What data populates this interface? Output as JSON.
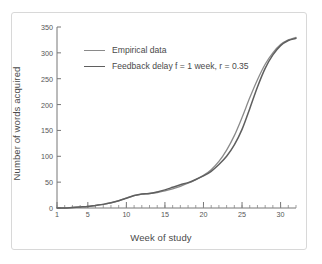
{
  "figure": {
    "frame_color": "#d8d8d8",
    "background": "#ffffff"
  },
  "chart_data": {
    "type": "line",
    "title": "",
    "xlabel": "Week of study",
    "ylabel": "Number of words acquired",
    "xlim": [
      1,
      32
    ],
    "ylim": [
      0,
      350
    ],
    "xticks": [
      1,
      5,
      10,
      15,
      20,
      25,
      30
    ],
    "yticks": [
      0,
      50,
      100,
      150,
      200,
      250,
      300,
      350
    ],
    "xtick_labels": [
      "1",
      "5",
      "10",
      "15",
      "20",
      "25",
      "30"
    ],
    "ytick_labels": [
      "0",
      "50",
      "100",
      "150",
      "200",
      "250",
      "300",
      "350"
    ],
    "minor_xticks_every": 1,
    "grid": false,
    "legend_position": "upper left",
    "x": [
      1,
      2,
      3,
      4,
      5,
      6,
      7,
      8,
      9,
      10,
      11,
      12,
      13,
      14,
      15,
      16,
      17,
      18,
      19,
      20,
      21,
      22,
      23,
      24,
      25,
      26,
      27,
      28,
      29,
      30,
      31,
      32
    ],
    "series": [
      {
        "name": "Empirical data",
        "color": "#8a8a8a",
        "linewidth": 1.3,
        "values": [
          0,
          0,
          1,
          2,
          3,
          5,
          7,
          10,
          14,
          19,
          24,
          27,
          28,
          30,
          33,
          37,
          42,
          48,
          55,
          63,
          74,
          90,
          112,
          140,
          175,
          213,
          248,
          278,
          300,
          316,
          325,
          330
        ]
      },
      {
        "name": "Feedback delay f = 1 week, r = 0.35",
        "color": "#5f5f5f",
        "linewidth": 1.5,
        "values": [
          0,
          0,
          1,
          2,
          3,
          5,
          7,
          10,
          14,
          19,
          24,
          27,
          28,
          31,
          35,
          40,
          45,
          49,
          55,
          62,
          71,
          84,
          100,
          122,
          152,
          192,
          234,
          270,
          296,
          314,
          324,
          328
        ]
      }
    ]
  },
  "legend": {
    "entries": [
      {
        "label": "Empirical data",
        "color": "#8a8a8a",
        "thickness": "1.3px"
      },
      {
        "label": "Feedback delay f = 1 week, r = 0.35",
        "color": "#5f5f5f",
        "thickness": "1.6px"
      }
    ]
  }
}
